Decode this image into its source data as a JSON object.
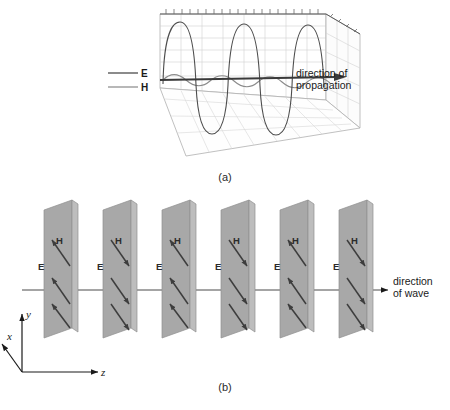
{
  "figure": {
    "panels": [
      {
        "id": "a",
        "caption": "(a)",
        "legend": [
          {
            "symbol": "E",
            "color": "#5a5a5a",
            "name": "electric-field"
          },
          {
            "symbol": "H",
            "color": "#9a9a9a",
            "name": "magnetic-field"
          }
        ],
        "annotation_line1": "direction of",
        "annotation_line2": "propagation",
        "wave": {
          "e_cycles": 4,
          "h_cycles": 4,
          "e_color": "#4d4d4d",
          "h_color": "#8c8c8c",
          "grid_color": "#cccccc",
          "box_color": "#9a9a9a",
          "axis_color": "#3a3a3a"
        }
      },
      {
        "id": "b",
        "caption": "(b)",
        "annotation_line1": "direction",
        "annotation_line2": "of wave",
        "plane_count": 6,
        "plane_fill": "#a8a8a8",
        "plane_edge": "#8a8a8a",
        "arrow_color": "#3d3d3d",
        "axis_color": "#1a1a1a",
        "field_labels": {
          "e": "E",
          "h": "H"
        },
        "axes": [
          {
            "label": "x",
            "name": "x-axis"
          },
          {
            "label": "y",
            "name": "y-axis"
          },
          {
            "label": "z",
            "name": "z-axis"
          }
        ],
        "planes": [
          {
            "index": 1,
            "direction": "up"
          },
          {
            "index": 2,
            "direction": "down"
          },
          {
            "index": 3,
            "direction": "up"
          },
          {
            "index": 4,
            "direction": "down"
          },
          {
            "index": 5,
            "direction": "up"
          },
          {
            "index": 6,
            "direction": "down"
          }
        ]
      }
    ]
  }
}
